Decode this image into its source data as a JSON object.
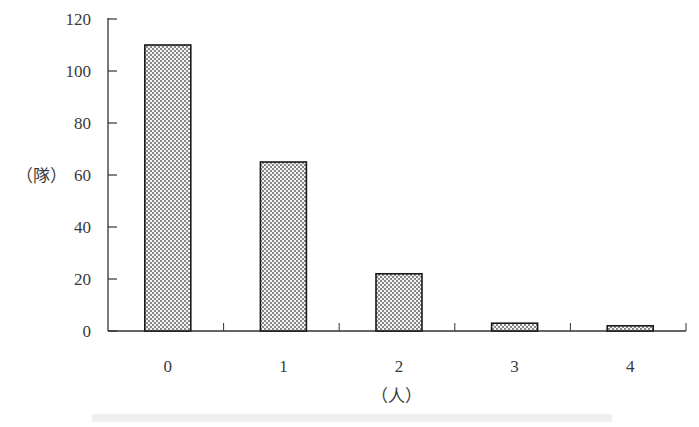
{
  "chart_data": {
    "type": "bar",
    "title": "",
    "xlabel": "（人）",
    "ylabel": "（隊）",
    "categories": [
      "0",
      "1",
      "2",
      "3",
      "4"
    ],
    "values": [
      110,
      65,
      22,
      3,
      2
    ],
    "ylim": [
      0,
      120
    ],
    "yticks": [
      "0",
      "20",
      "40",
      "60",
      "80",
      "100",
      "120"
    ],
    "grid": false,
    "legend": null,
    "bar_fill": "dotted pattern",
    "caption": "(faded, illegible caption text)"
  },
  "style": {
    "axis_color": "#333333",
    "bar_stroke": "#1a1a1a",
    "dot_color": "#555555",
    "background": "#ffffff"
  }
}
